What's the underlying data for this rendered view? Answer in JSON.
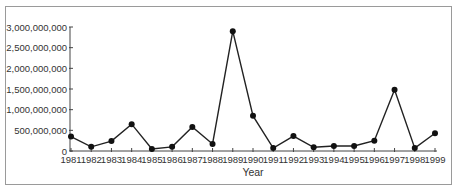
{
  "chart_data": {
    "type": "line",
    "title": "",
    "xlabel": "Year",
    "ylabel": "",
    "x": [
      "1981",
      "1982",
      "1983",
      "1984",
      "1985",
      "1986",
      "1987",
      "1988",
      "1989",
      "1990",
      "1991",
      "1992",
      "1993",
      "1994",
      "1995",
      "1996",
      "1997",
      "1998",
      "1999"
    ],
    "series": [
      {
        "name": "",
        "values": [
          350000000,
          100000000,
          240000000,
          650000000,
          50000000,
          100000000,
          580000000,
          170000000,
          2900000000,
          850000000,
          70000000,
          360000000,
          90000000,
          120000000,
          120000000,
          250000000,
          1480000000,
          70000000,
          430000000
        ]
      }
    ],
    "ylim": [
      0,
      3000000000
    ],
    "yticks": [
      0,
      500000000,
      1000000000,
      1500000000,
      2000000000,
      2500000000,
      3000000000
    ],
    "ytick_labels": [
      "0",
      "500,000,000",
      "1,000,000,000",
      "1,500,000,000",
      "2,000,000,000",
      "2,500,000,000",
      "3,000,000,000"
    ],
    "grid": false,
    "legend": "none",
    "colors": {
      "line": "#222222",
      "marker": "#111111",
      "axis": "#444444",
      "frame": "#9a9a9a"
    }
  }
}
